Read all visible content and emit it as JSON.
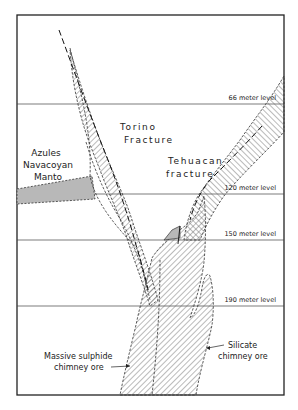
{
  "diagram": {
    "levels": [
      {
        "label": "66 meter level",
        "y": 104
      },
      {
        "label": "120 meter level",
        "y": 194
      },
      {
        "label": "150 meter level",
        "y": 240
      },
      {
        "label": "190 meter level",
        "y": 306
      }
    ],
    "labels": {
      "azules_1": "Azules",
      "azules_2": "Navacoyan",
      "azules_3": "Manto",
      "torino_1": "Torino",
      "torino_2": "Fracture",
      "tehuacan_1": "Tehuacan",
      "tehuacan_2": "fracture",
      "massive_1": "Massive sulphide",
      "massive_2": "chimney ore",
      "silicate_1": "Silicate",
      "silicate_2": "chimney ore"
    },
    "colors": {
      "line": "#222222",
      "hatch": "#555555",
      "manto_fill": "#b8b8b8"
    }
  }
}
